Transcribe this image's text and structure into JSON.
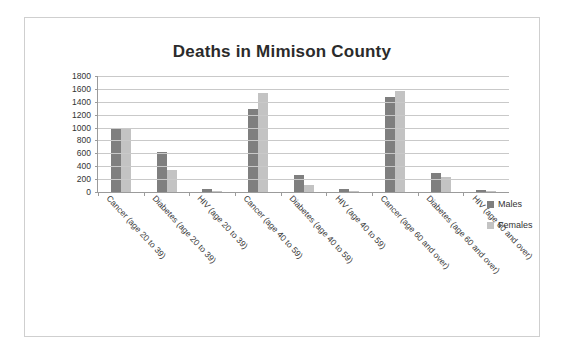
{
  "chart_data": {
    "type": "bar",
    "title": "Deaths in Mimison County",
    "xlabel": "",
    "ylabel": "",
    "ylim": [
      0,
      1800
    ],
    "ytick_step": 200,
    "yticks": [
      1800,
      1600,
      1400,
      1200,
      1000,
      800,
      600,
      400,
      200,
      0
    ],
    "grid": true,
    "legend_position": "right",
    "categories": [
      "Cancer (age 20 to 39)",
      "Diabetes (age 20 to 39)",
      "HIV (age 20 to 39)",
      "Cancer (age 40 to 59)",
      "Diabetes (age 40 to 59)",
      "HIV (age 40 to 59)",
      "Cancer (age 60 and over)",
      "Diabetes (age 60 and over)",
      "HIV (age 60 and over)"
    ],
    "series": [
      {
        "name": "Males",
        "color": "#7f7f7f",
        "values": [
          1000,
          620,
          40,
          1290,
          270,
          40,
          1480,
          300,
          30
        ]
      },
      {
        "name": "Females",
        "color": "#c3c3c3",
        "values": [
          1000,
          340,
          10,
          1540,
          110,
          10,
          1560,
          230,
          15
        ]
      }
    ]
  },
  "legend": {
    "items": [
      {
        "label": "Males"
      },
      {
        "label": "Females"
      }
    ]
  }
}
